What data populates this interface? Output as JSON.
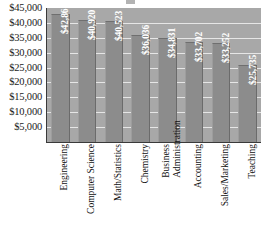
{
  "chart_data": {
    "type": "bar",
    "title": "",
    "xlabel": "",
    "ylabel": "",
    "categories": [
      "Engineering",
      "Computer Science",
      "Math/Statistics",
      "Chemistry",
      "Business Administration",
      "Accounting",
      "Sales/Marketing",
      "Teaching"
    ],
    "category_lines": [
      [
        "Engineering"
      ],
      [
        "Computer Science"
      ],
      [
        "Math/Statistics"
      ],
      [
        "Chemistry"
      ],
      [
        "Business",
        "Administration"
      ],
      [
        "Accounting"
      ],
      [
        "Sales/Marketing"
      ],
      [
        "Teaching"
      ]
    ],
    "values": [
      42862,
      40920,
      40523,
      36036,
      34831,
      33702,
      33252,
      25735
    ],
    "value_labels": [
      "$42,862",
      "$40,920",
      "$40,523",
      "$36,036",
      "$34,831",
      "$33,702",
      "$33,252",
      "$25,735"
    ],
    "ylim": [
      0,
      45000
    ],
    "ytick_values": [
      45000,
      40000,
      35000,
      30000,
      25000,
      20000,
      15000,
      10000,
      5000
    ],
    "ytick_labels": [
      "$45,000",
      "$40,000",
      "$35,000",
      "$30,000",
      "$25,000",
      "$20,000",
      "$15,000",
      "$10,000",
      "$5,000"
    ],
    "grid": true,
    "legend": false,
    "colors": {
      "plot_background": "#a8a8a8",
      "bar_fill": "#8c8c8c",
      "gridline": "#e6e6e6",
      "axis_line": "#3a3a3a",
      "value_label_text": "#ffffff",
      "tick_label_text": "#111111",
      "page_background": "#ffffff"
    }
  }
}
